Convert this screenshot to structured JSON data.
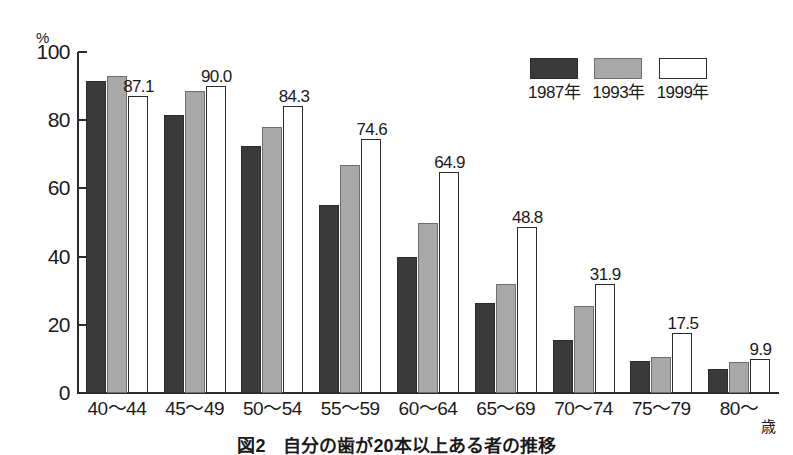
{
  "chart_data": {
    "type": "bar",
    "title": "図2　自分の歯が20本以上ある者の推移",
    "xlabel": "",
    "ylabel": "",
    "yunit": "%",
    "ylim": [
      0,
      100
    ],
    "yticks": [
      0,
      20,
      40,
      60,
      80,
      100
    ],
    "grid": false,
    "legend_position": "top-right",
    "categories": [
      "40〜44",
      "45〜49",
      "50〜54",
      "55〜59",
      "60〜64",
      "65〜69",
      "70〜74",
      "75〜79",
      "80〜"
    ],
    "category_suffix": "歳",
    "series": [
      {
        "name": "1987年",
        "color": "#3a3a3a",
        "values": [
          91.5,
          81.5,
          72.5,
          55.0,
          40.0,
          26.5,
          15.5,
          9.5,
          7.0
        ],
        "labels_shown": false
      },
      {
        "name": "1993年",
        "color": "#a8a8a8",
        "values": [
          93.0,
          88.5,
          78.0,
          67.0,
          50.0,
          32.0,
          25.5,
          10.5,
          9.0
        ],
        "labels_shown": false
      },
      {
        "name": "1999年",
        "color": "#ffffff",
        "values": [
          87.1,
          90.0,
          84.3,
          74.6,
          64.9,
          48.8,
          31.9,
          17.5,
          9.9
        ],
        "labels_shown": true,
        "value_labels": [
          "87.1",
          "90.0",
          "84.3",
          "74.6",
          "64.9",
          "48.8",
          "31.9",
          "17.5",
          "9.9"
        ]
      }
    ]
  },
  "axis": {
    "unit_label": "%",
    "tick_labels": [
      "100",
      "80",
      "60",
      "40",
      "20",
      "0"
    ]
  },
  "legend": {
    "items": [
      {
        "label": "1987年",
        "swatch": "dark-swatch"
      },
      {
        "label": "1993年",
        "swatch": "gray-swatch"
      },
      {
        "label": "1999年",
        "swatch": "white-swatch"
      }
    ]
  },
  "caption": {
    "text": "図2　自分の歯が20本以上ある者の推移"
  }
}
